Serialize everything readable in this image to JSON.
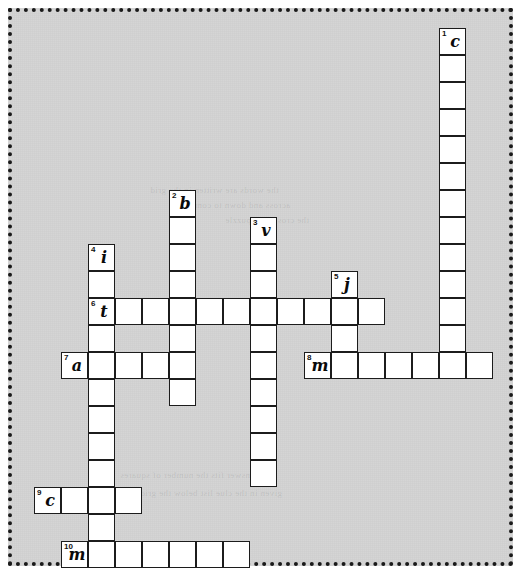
{
  "puzzle": {
    "title": "crossword-grid",
    "background_color": "#d3d3d3",
    "cell_color": "#ffffff",
    "border_color": "#1c1c1c",
    "cell_size": 27,
    "origin": {
      "x": 34,
      "y": 28
    },
    "entries": [
      {
        "number": "1",
        "letter": "c",
        "direction": "down",
        "col": 15,
        "row": 0,
        "length": 12
      },
      {
        "number": "2",
        "letter": "b",
        "direction": "down",
        "col": 5,
        "row": 6,
        "length": 8
      },
      {
        "number": "3",
        "letter": "v",
        "direction": "down",
        "col": 8,
        "row": 7,
        "length": 10
      },
      {
        "number": "4",
        "letter": "i",
        "direction": "down",
        "col": 2,
        "row": 8,
        "length": 11
      },
      {
        "number": "5",
        "letter": "j",
        "direction": "down",
        "col": 11,
        "row": 9,
        "length": 3
      },
      {
        "number": "6",
        "letter": "t",
        "direction": "across",
        "col": 2,
        "row": 10,
        "length": 11
      },
      {
        "number": "7",
        "letter": "a",
        "direction": "across",
        "col": 1,
        "row": 12,
        "length": 5
      },
      {
        "number": "8",
        "letter": "m",
        "direction": "across",
        "col": 10,
        "row": 12,
        "length": 7
      },
      {
        "number": "9",
        "letter": "c",
        "direction": "across",
        "col": 0,
        "row": 17,
        "length": 4
      },
      {
        "number": "10",
        "letter": "m",
        "direction": "across",
        "col": 1,
        "row": 19,
        "length": 7
      }
    ],
    "ghost_text": [
      {
        "x": 150,
        "y": 185,
        "text": "the words are written in the grid"
      },
      {
        "x": 175,
        "y": 200,
        "text": "across and down to complete"
      },
      {
        "x": 225,
        "y": 215,
        "text": "the crossword puzzle"
      },
      {
        "x": 120,
        "y": 470,
        "text": "each answer fits the number of squares"
      },
      {
        "x": 140,
        "y": 488,
        "text": "given in the clue list below the grid"
      }
    ]
  }
}
